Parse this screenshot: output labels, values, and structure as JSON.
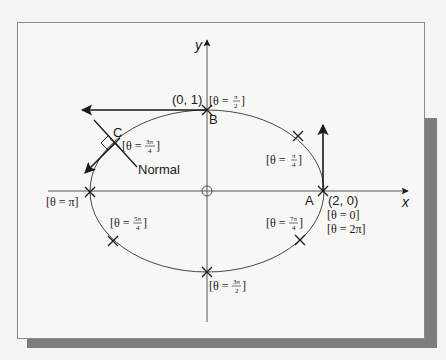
{
  "figure": {
    "axes": {
      "x_label": "x",
      "y_label": "y"
    },
    "points": {
      "A": {
        "name": "A",
        "coord": "(2, 0)",
        "theta_lines": [
          "[θ = 0]",
          "[θ = 2π]"
        ]
      },
      "B": {
        "name": "B",
        "coord": "(0, 1)",
        "theta_prefix": "[θ =",
        "theta_num": "π",
        "theta_den": "2",
        "theta_suffix": "]"
      },
      "C": {
        "name": "C",
        "theta_prefix": "[θ =",
        "theta_num": "3π",
        "theta_den": "4",
        "theta_suffix": "]"
      }
    },
    "normal_label": "Normal",
    "markers": [
      {
        "id": "pi4",
        "theta_prefix": "[θ =",
        "theta_num": "π",
        "theta_den": "4",
        "theta_suffix": "]"
      },
      {
        "id": "pi",
        "theta_text": "[θ = π]"
      },
      {
        "id": "5pi4",
        "theta_prefix": "[θ =",
        "theta_num": "5π",
        "theta_den": "4",
        "theta_suffix": "]"
      },
      {
        "id": "7pi4",
        "theta_prefix": "[θ =",
        "theta_num": "7π",
        "theta_den": "4",
        "theta_suffix": "]"
      },
      {
        "id": "3pi2",
        "theta_prefix": "[θ =",
        "theta_num": "3π",
        "theta_den": "2",
        "theta_suffix": "]"
      }
    ],
    "colors": {
      "line": "#1a1a1a",
      "axis": "#555555",
      "frame": "#8a8a8a",
      "shadow": "#7d7d7d"
    }
  }
}
